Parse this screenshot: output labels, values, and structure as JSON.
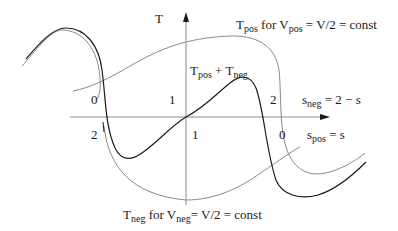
{
  "figure": {
    "axis_labels": {
      "vertical": "T"
    },
    "curve_labels": {
      "t_pos": {
        "main": "T",
        "sub": "pos",
        "mid": " for V",
        "mid_sub": "pos",
        "tail": " = V/2 = const"
      },
      "t_neg": {
        "main": "T",
        "sub": "neg",
        "mid": " for V",
        "mid_sub": "neg",
        "tail": "= V/2 = const"
      },
      "sum": {
        "a": "T",
        "a_sub": "pos",
        "op": " + T",
        "b_sub": "neg"
      }
    },
    "scale_labels": {
      "s_neg": {
        "main": "s",
        "sub": "neg",
        "tail": " = 2 − s"
      },
      "s_pos": {
        "main": "s",
        "sub": "pos",
        "tail": " = s"
      }
    },
    "ticks_upper": [
      "0",
      "1",
      "2"
    ],
    "ticks_lower": [
      "2",
      "1",
      "0"
    ],
    "colors": {
      "sum_curve": "#1a1a1a",
      "component_curves": "#8a8a8a",
      "axes": "#8a8a8a",
      "text": "#1a1a1a"
    }
  }
}
